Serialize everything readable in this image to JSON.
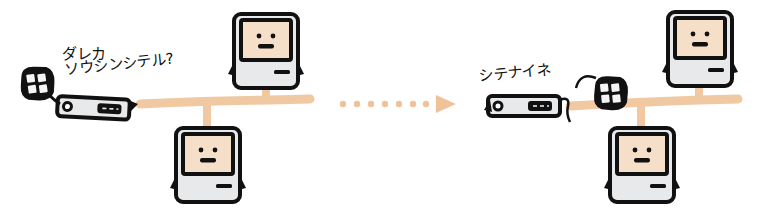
{
  "diagram": {
    "type": "network-transition",
    "colors": {
      "cable": "#f0c9a2",
      "arrow": "#f0c29a",
      "screen": "#f6dfc9",
      "body": "#e8e9ea",
      "outline": "#111111",
      "background": "#ffffff"
    },
    "before": {
      "router_label_line1": "ダレカ",
      "router_label_line2": "ソウシンシテル?",
      "nodes": [
        "router-with-cable-ball",
        "computer-top",
        "computer-bottom"
      ]
    },
    "transition": {
      "arrow": "dotted-arrow-right"
    },
    "after": {
      "router_label": "シテナイネ",
      "nodes": [
        "router",
        "cable-ball",
        "computer-top",
        "computer-bottom"
      ]
    }
  }
}
